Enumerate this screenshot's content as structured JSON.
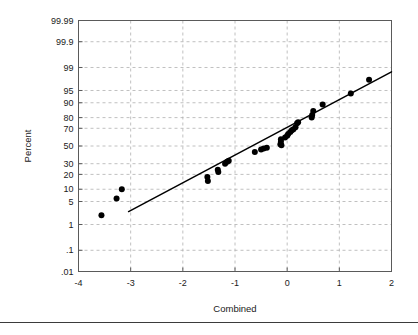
{
  "figure": {
    "background": "#ffffff",
    "frame_color": "#5a5a5a",
    "grid_color": "#b0b0b0",
    "marker_color": "#000000",
    "line_color": "#000000",
    "footer_rule_color": "#3b3b3b"
  },
  "chart_data": {
    "type": "scatter",
    "title": "",
    "subtitle": "",
    "xlabel": "Combined",
    "ylabel": "Percent",
    "xlim": [
      -4,
      2
    ],
    "ylim_percent": [
      0.01,
      99.99
    ],
    "grid": true,
    "legend": null,
    "x_ticks": [
      -4,
      -3,
      -2,
      -1,
      0,
      1,
      2
    ],
    "x_tick_labels": [
      "-4",
      "-3",
      "-2",
      "-1",
      "0",
      "1",
      "2"
    ],
    "y_ticks_percent": [
      99.99,
      99.9,
      99,
      95,
      90,
      80,
      70,
      50,
      30,
      20,
      10,
      5,
      1,
      0.1,
      0.01
    ],
    "y_tick_labels": [
      "99.99",
      "99.9",
      "99",
      "95",
      "90",
      "80",
      "70",
      "50",
      "30",
      "20",
      "10",
      "5",
      "1",
      ".1",
      ".01"
    ],
    "y_scale": "normal-probability",
    "series": [
      {
        "name": "data",
        "marker": "filled-circle",
        "points": [
          {
            "x": -3.56,
            "y": 2.0
          },
          {
            "x": -3.27,
            "y": 6.0
          },
          {
            "x": -3.17,
            "y": 10.0
          },
          {
            "x": -1.53,
            "y": 18.0
          },
          {
            "x": -1.52,
            "y": 15.0
          },
          {
            "x": -1.33,
            "y": 24.0
          },
          {
            "x": -1.32,
            "y": 22.0
          },
          {
            "x": -1.19,
            "y": 30.0
          },
          {
            "x": -1.15,
            "y": 32.0
          },
          {
            "x": -1.12,
            "y": 33.0
          },
          {
            "x": -0.62,
            "y": 43.0
          },
          {
            "x": -0.5,
            "y": 46.0
          },
          {
            "x": -0.45,
            "y": 47.0
          },
          {
            "x": -0.39,
            "y": 48.0
          },
          {
            "x": -0.13,
            "y": 52.0
          },
          {
            "x": -0.12,
            "y": 55.0
          },
          {
            "x": -0.12,
            "y": 58.0
          },
          {
            "x": -0.11,
            "y": 51.0
          },
          {
            "x": -0.04,
            "y": 60.0
          },
          {
            "x": 0.0,
            "y": 62.0
          },
          {
            "x": 0.02,
            "y": 64.0
          },
          {
            "x": 0.06,
            "y": 66.0
          },
          {
            "x": 0.09,
            "y": 68.0
          },
          {
            "x": 0.12,
            "y": 69.0
          },
          {
            "x": 0.16,
            "y": 71.0
          },
          {
            "x": 0.19,
            "y": 75.0
          },
          {
            "x": 0.21,
            "y": 76.0
          },
          {
            "x": 0.47,
            "y": 80.0
          },
          {
            "x": 0.48,
            "y": 82.0
          },
          {
            "x": 0.5,
            "y": 85.0
          },
          {
            "x": 0.68,
            "y": 89.0
          },
          {
            "x": 1.22,
            "y": 94.0
          },
          {
            "x": 1.57,
            "y": 97.5
          }
        ]
      }
    ],
    "fit_line": {
      "name": "reference-line",
      "x_start": -3.04,
      "y_start_percent": 2.6,
      "x_end": 2.0,
      "y_end_percent": 98.6
    }
  }
}
